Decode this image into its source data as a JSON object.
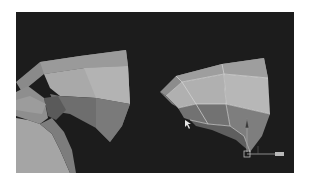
{
  "viewport": {
    "background": "#1c1c1c",
    "objects": [
      {
        "name": "left-mesh",
        "type": "curved-tube-segment"
      },
      {
        "name": "right-mesh",
        "type": "selected-quad-patch"
      }
    ],
    "gizmo": {
      "type": "move-manipulator"
    },
    "cursor": {
      "type": "arrow"
    }
  }
}
